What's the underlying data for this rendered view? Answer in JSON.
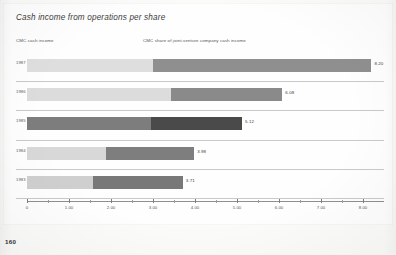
{
  "page": {
    "number": "160"
  },
  "chart_data": {
    "type": "bar",
    "orientation": "horizontal",
    "stacked": true,
    "title": "Cash income from operations per share",
    "xlabel": "",
    "ylabel": "",
    "categories": [
      "1987",
      "1986",
      "1985",
      "1984",
      "1983"
    ],
    "xlim": [
      0,
      8.5
    ],
    "grid": false,
    "legend_position": "top",
    "axis": {
      "major_ticks": [
        0,
        1.0,
        2.0,
        3.0,
        4.0,
        5.0,
        6.0,
        7.0,
        8.0
      ],
      "major_tick_labels": [
        "0",
        "1.00",
        "2.00",
        "3.00",
        "4.00",
        "5.00",
        "6.00",
        "7.00",
        "8.00"
      ],
      "minor_ticks": [
        0.5,
        1.5,
        2.5,
        3.5,
        4.5,
        5.5,
        6.5,
        7.5
      ]
    },
    "series": [
      {
        "name": "CMC cash income",
        "color": "#d9d9d9",
        "values": [
          3.0,
          3.42,
          2.95,
          1.88,
          1.58
        ]
      },
      {
        "name": "CMC share of joint-venture company cash income",
        "color": "#8d8d8d",
        "values": [
          5.2,
          2.66,
          2.17,
          2.1,
          2.13
        ]
      }
    ],
    "totals": [
      8.2,
      6.08,
      5.12,
      3.98,
      3.71
    ],
    "total_labels": [
      "8.20",
      "6.08",
      "5.12",
      "3.98",
      "3.71"
    ],
    "row_colors": [
      {
        "light": "#dedede",
        "dark": "#8f8f8f"
      },
      {
        "light": "#dcdcdc",
        "dark": "#8a8a8a"
      },
      {
        "light": "#7d7d7d",
        "dark": "#4a4a4a"
      },
      {
        "light": "#d8d8d8",
        "dark": "#7e7e7e"
      },
      {
        "light": "#cfcfcf",
        "dark": "#787878"
      }
    ]
  },
  "legend": {
    "items": [
      {
        "label": "CMC cash income"
      },
      {
        "label": "CMC share of joint-venture company cash income"
      }
    ]
  }
}
